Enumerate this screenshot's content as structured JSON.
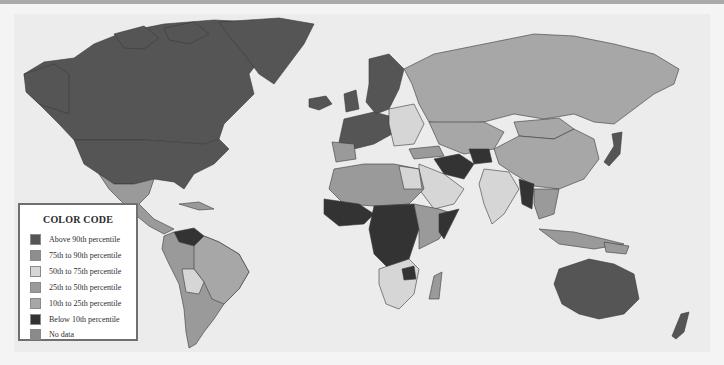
{
  "map": {
    "legend": {
      "title": "COLOR CODE",
      "items": [
        {
          "label": "Above 90th percentile",
          "color": "#555555"
        },
        {
          "label": "75th to 90th percentile",
          "color": "#8e8e8e"
        },
        {
          "label": "50th to 75th percentile",
          "color": "#d6d6d6"
        },
        {
          "label": "25th to 50th percentile",
          "color": "#9a9a9a"
        },
        {
          "label": "10th to 25th percentile",
          "color": "#a7a7a7"
        },
        {
          "label": "Below 10th percentile",
          "color": "#333333"
        },
        {
          "label": "No data",
          "color": "#8a8a8a"
        }
      ]
    },
    "colors": {
      "background": "#ececec",
      "above_90": "#555555",
      "p75_90": "#8e8e8e",
      "p50_75": "#d6d6d6",
      "p25_50": "#9a9a9a",
      "p10_25": "#a7a7a7",
      "below_10": "#333333",
      "no_data": "#8a8a8a"
    }
  }
}
